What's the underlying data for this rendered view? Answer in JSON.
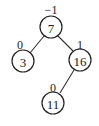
{
  "diagram": {
    "type": "AVL tree with balance factors",
    "nodes": [
      {
        "id": "n7",
        "key": "7",
        "balance": "−1",
        "cx": 51,
        "cy": 27,
        "bx": 51,
        "by": 10
      },
      {
        "id": "n3",
        "key": "3",
        "balance": "0",
        "cx": 23,
        "cy": 61,
        "bx": 20,
        "by": 45
      },
      {
        "id": "n16",
        "key": "16",
        "balance": "1",
        "cx": 80,
        "cy": 60,
        "bx": 80,
        "by": 45
      },
      {
        "id": "n11",
        "key": "11",
        "balance": "0",
        "cx": 53,
        "cy": 103,
        "bx": 53,
        "by": 88
      }
    ],
    "edges": [
      {
        "from": "7",
        "to": "3"
      },
      {
        "from": "7",
        "to": "16"
      },
      {
        "from": "16",
        "to": "11"
      }
    ],
    "node_radius": 11
  }
}
